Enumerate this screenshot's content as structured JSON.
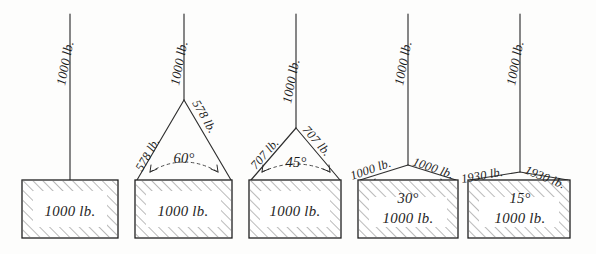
{
  "diagram": {
    "background_color": "#fdfdfc",
    "ink_color": "#1d1d1d",
    "unit": "lb.",
    "figures": [
      {
        "id": "figure-1",
        "arrangement": "single-vertical-rope",
        "top_load_label": "1000 lb.",
        "angle_label": "",
        "leg_label_left": "",
        "leg_label_right": "",
        "block_label": "1000 lb.",
        "leg_tension": 1000,
        "angle_degrees": 90,
        "weight": 1000
      },
      {
        "id": "figure-2",
        "arrangement": "two-leg-sling",
        "top_load_label": "1000 lb.",
        "angle_label": "60°",
        "leg_label_left": "578 lb.",
        "leg_label_right": "578 lb.",
        "block_label": "1000 lb.",
        "leg_tension": 578,
        "angle_degrees": 60,
        "weight": 1000
      },
      {
        "id": "figure-3",
        "arrangement": "two-leg-sling",
        "top_load_label": "1000 lb.",
        "angle_label": "45°",
        "leg_label_left": "707 lb.",
        "leg_label_right": "707 lb.",
        "block_label": "1000 lb.",
        "leg_tension": 707,
        "angle_degrees": 45,
        "weight": 1000
      },
      {
        "id": "figure-4",
        "arrangement": "two-leg-sling",
        "top_load_label": "1000 lb.",
        "angle_label": "30°",
        "leg_label_left": "1000 lb.",
        "leg_label_right": "1000 lb.",
        "block_label": "1000 lb.",
        "leg_tension": 1000,
        "angle_degrees": 30,
        "weight": 1000
      },
      {
        "id": "figure-5",
        "arrangement": "two-leg-sling",
        "top_load_label": "1000 lb.",
        "angle_label": "15°",
        "leg_label_left": "1930 lb.",
        "leg_label_right": "1930 lb.",
        "block_label": "1000 lb.",
        "leg_tension": 1930,
        "angle_degrees": 15,
        "weight": 1000
      }
    ]
  }
}
